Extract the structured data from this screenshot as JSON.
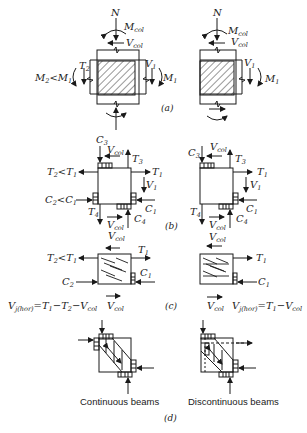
{
  "figure": {
    "panels": {
      "a": {
        "label": "(a)"
      },
      "b": {
        "label": "(b)"
      },
      "c": {
        "label": "(c)"
      },
      "d": {
        "label": "(d)"
      }
    },
    "labels": {
      "N": "N",
      "M": "M",
      "V": "V",
      "T": "T",
      "C": "C",
      "col": "col",
      "jhor": "j(hor)",
      "s1": "1",
      "s2": "2",
      "s3": "3",
      "s4": "4",
      "lt": "<",
      "eq": "=",
      "minus": "−"
    },
    "captions": {
      "continuous": "Continuous beams",
      "discontinuous": "Discontinuous beams"
    },
    "equations": {
      "left": "V_j(hor) = T1 − T2 − Vcol",
      "right": "V_j(hor) = T1 − Vcol"
    },
    "colors": {
      "ink": "#1a1a1a",
      "background": "#ffffff"
    }
  }
}
